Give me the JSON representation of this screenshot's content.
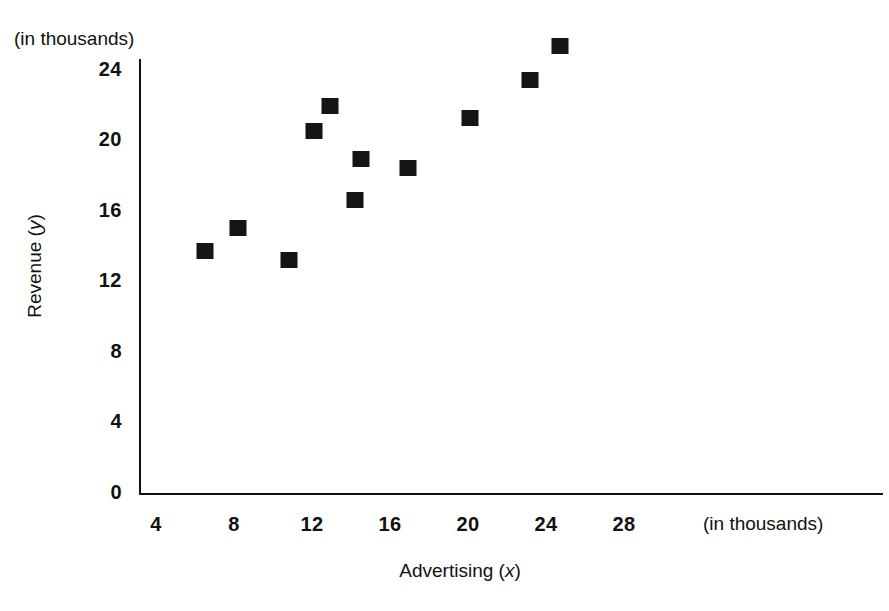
{
  "chart_data": {
    "type": "scatter",
    "title": "",
    "xlabel": "Advertising (x)",
    "ylabel": "Revenue (y)",
    "x_units_note": "(in thousands)",
    "y_units_note": "(in thousands)",
    "xlim": [
      2,
      40
    ],
    "ylim": [
      0,
      26
    ],
    "grid": false,
    "legend": null,
    "xticks": [
      4,
      8,
      12,
      16,
      20,
      24,
      28
    ],
    "xtick_labels": [
      "4",
      "8",
      "12",
      "16",
      "20",
      "24",
      "28"
    ],
    "yticks": [
      0,
      4,
      8,
      12,
      16,
      20,
      24
    ],
    "ytick_labels": [
      "0",
      "4",
      "8",
      "12",
      "16",
      "20",
      "24"
    ],
    "marker": "filled-square",
    "marker_color": "#151515",
    "points": [
      {
        "x": 6.5,
        "y": 13.8
      },
      {
        "x": 8.2,
        "y": 15.1
      },
      {
        "x": 10.8,
        "y": 13.3
      },
      {
        "x": 12.1,
        "y": 20.6
      },
      {
        "x": 12.9,
        "y": 22.0
      },
      {
        "x": 14.2,
        "y": 16.7
      },
      {
        "x": 14.5,
        "y": 19.0
      },
      {
        "x": 16.9,
        "y": 18.5
      },
      {
        "x": 20.1,
        "y": 21.3
      },
      {
        "x": 23.2,
        "y": 23.5
      },
      {
        "x": 24.7,
        "y": 25.4
      }
    ]
  },
  "axes": {
    "x_axis_label": "Advertising (x)",
    "x_axis_label_text": "Advertising (",
    "x_axis_var": "x",
    "x_axis_label_close": ")",
    "y_axis_label_text": "Revenue (",
    "y_axis_var": "y",
    "y_axis_label_close": ")",
    "x_units": "(in thousands)",
    "y_units": "(in thousands)"
  },
  "geometry": {
    "x_pixel_at_4": 156,
    "x_pixels_per_unit": 19.5,
    "y_pixel_at_0": 494,
    "y_pixels_per_unit": 17.63
  }
}
